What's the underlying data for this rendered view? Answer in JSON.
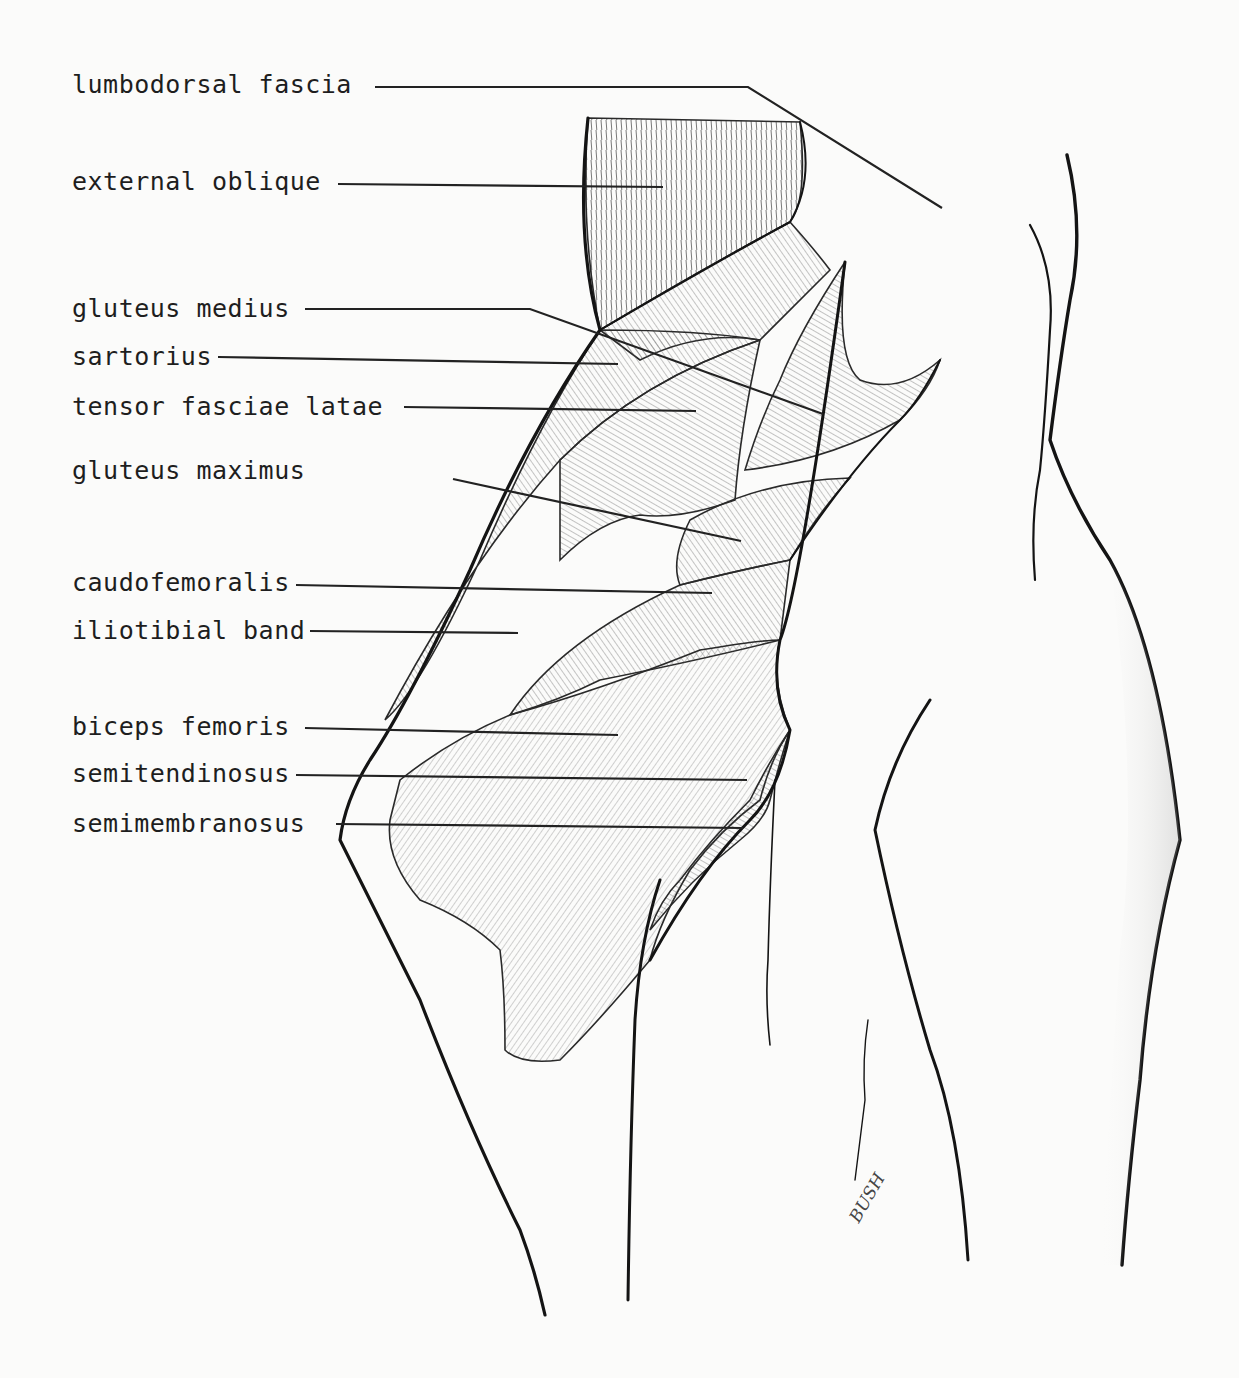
{
  "figure": {
    "type": "anatomical illustration",
    "signature": "BUSH",
    "colors": {
      "ink": "#141414",
      "background": "#fbfbfa",
      "hatch": "#6a6a6a"
    }
  },
  "labels": [
    {
      "id": "lumbodorsal-fascia",
      "text": "lumbodorsal fascia",
      "x": 72,
      "y": 93
    },
    {
      "id": "external-oblique",
      "text": "external oblique",
      "x": 72,
      "y": 190
    },
    {
      "id": "gluteus-medius",
      "text": "gluteus medius",
      "x": 72,
      "y": 317
    },
    {
      "id": "sartorius",
      "text": "sartorius",
      "x": 72,
      "y": 365
    },
    {
      "id": "tensor-fasciae-latae",
      "text": "tensor fasciae latae",
      "x": 72,
      "y": 415
    },
    {
      "id": "gluteus-maximus",
      "text": "gluteus maximus",
      "x": 72,
      "y": 479
    },
    {
      "id": "caudofemoralis",
      "text": "caudofemoralis",
      "x": 72,
      "y": 591
    },
    {
      "id": "iliotibial-band",
      "text": "iliotibial band",
      "x": 72,
      "y": 639
    },
    {
      "id": "biceps-femoris",
      "text": "biceps femoris",
      "x": 72,
      "y": 735
    },
    {
      "id": "semitendinosus",
      "text": "semitendinosus",
      "x": 72,
      "y": 782
    },
    {
      "id": "semimembranosus",
      "text": "semimembranosus",
      "x": 72,
      "y": 832
    }
  ]
}
